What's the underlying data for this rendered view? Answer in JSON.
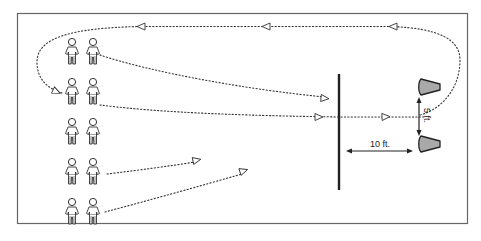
{
  "diagram": {
    "type": "drill-diagram",
    "border_color": "#555555",
    "line_color": "#222222",
    "cone_fill": "#a9a9a9",
    "players": {
      "rows": 5,
      "per_row": 2,
      "count": 10
    },
    "barrier": {
      "label": ""
    },
    "cones": {
      "count": 2
    },
    "measurements": {
      "horizontal_label": "10 ft.",
      "vertical_label": "5 ft."
    }
  }
}
